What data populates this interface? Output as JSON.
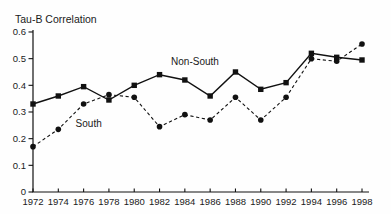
{
  "figure": {
    "background": "#fefefe",
    "ink_color": "#111111"
  },
  "chart_data": {
    "type": "line",
    "title": "Tau-B Correlation",
    "xlabel": "",
    "ylabel": "Tau-B Correlation",
    "x": [
      1972,
      1974,
      1976,
      1978,
      1980,
      1982,
      1984,
      1986,
      1988,
      1990,
      1992,
      1994,
      1996,
      1998
    ],
    "x_tick_labels": [
      "1972",
      "1974",
      "1976",
      "1978",
      "1980",
      "1982",
      "1984",
      "1986",
      "1988",
      "1990",
      "1992",
      "1994",
      "1996",
      "1998"
    ],
    "y_ticks": [
      0,
      0.1,
      0.2,
      0.3,
      0.4,
      0.5,
      0.6
    ],
    "y_tick_labels": [
      "0",
      "0.1",
      "0.2",
      "0.3",
      "0.4",
      "0.5",
      "0.6"
    ],
    "ylim": [
      0,
      0.6
    ],
    "xlim": [
      1972,
      1998
    ],
    "grid": false,
    "legend_position": "inline-annotations",
    "series": [
      {
        "name": "South",
        "marker": "circle",
        "line_style": "dashed",
        "color": "#111111",
        "values": [
          0.17,
          0.235,
          0.33,
          0.365,
          0.355,
          0.245,
          0.29,
          0.27,
          0.355,
          0.27,
          0.355,
          0.5,
          0.49,
          0.555
        ]
      },
      {
        "name": "Non-South",
        "marker": "square",
        "line_style": "solid",
        "color": "#111111",
        "values": [
          0.33,
          0.36,
          0.395,
          0.345,
          0.4,
          0.44,
          0.42,
          0.36,
          0.45,
          0.385,
          0.41,
          0.52,
          0.505,
          0.495
        ]
      }
    ],
    "annotations": [
      {
        "text": "Non-South",
        "x": 1984.8,
        "y": 0.487
      },
      {
        "text": "South",
        "x": 1976.4,
        "y": 0.255
      }
    ]
  }
}
